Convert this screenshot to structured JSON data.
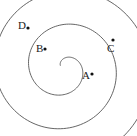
{
  "diagram": {
    "type": "spiral",
    "stroke_color": "#555555",
    "point_color": "#111111",
    "points": [
      {
        "label": "A",
        "x": 92,
        "y": 74,
        "lx": 82,
        "ly": 79
      },
      {
        "label": "B",
        "x": 45,
        "y": 49,
        "lx": 36,
        "ly": 52
      },
      {
        "label": "C",
        "x": 113,
        "y": 40,
        "lx": 107,
        "ly": 52
      },
      {
        "label": "D",
        "x": 28,
        "y": 28,
        "lx": 18,
        "ly": 29
      }
    ]
  }
}
